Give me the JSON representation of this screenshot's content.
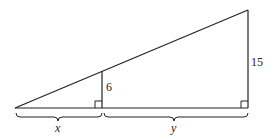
{
  "diagram": {
    "type": "similar right triangles",
    "labels": {
      "small_height": "6",
      "large_height": "15",
      "left_segment": "x",
      "right_segment": "y"
    },
    "colors": {
      "stroke": "#222222",
      "background": "#ffffff"
    }
  }
}
